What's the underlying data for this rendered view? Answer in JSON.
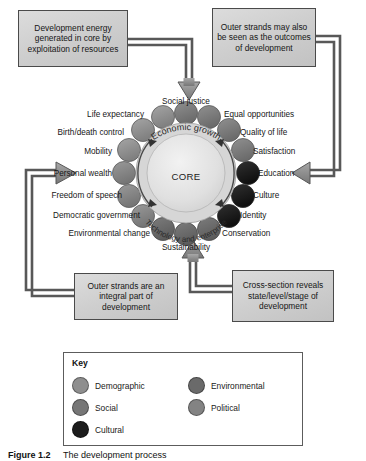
{
  "figure": {
    "caption_label": "Figure 1.2",
    "caption_text": "The development process"
  },
  "boxes": {
    "development_energy": "Development energy generated in core by exploitation of resources",
    "outer_strands_outcomes": "Outer strands may also be seen as the outcomes of development",
    "outer_strands_integral": "Outer strands are an integral part of development",
    "cross_section": "Cross-section reveals state/level/stage of development"
  },
  "core": {
    "center_label": "CORE",
    "top_arc": "Economic growth",
    "bottom_arc": "Technology and enterprise"
  },
  "ring_labels": [
    {
      "text": "Social justice",
      "category": "social"
    },
    {
      "text": "Equal opportunities",
      "category": "social"
    },
    {
      "text": "Quality of life",
      "category": "social"
    },
    {
      "text": "Satisfaction",
      "category": "social"
    },
    {
      "text": "Education",
      "category": "cultural"
    },
    {
      "text": "Culture",
      "category": "cultural"
    },
    {
      "text": "Identity",
      "category": "cultural"
    },
    {
      "text": "Conservation",
      "category": "environmental"
    },
    {
      "text": "Sustainability",
      "category": "environmental"
    },
    {
      "text": "Environmental change",
      "category": "environmental"
    },
    {
      "text": "Democratic government",
      "category": "political"
    },
    {
      "text": "Freedom of speech",
      "category": "political"
    },
    {
      "text": "Personal wealth",
      "category": "political"
    },
    {
      "text": "Mobility",
      "category": "demographic"
    },
    {
      "text": "Birth/death control",
      "category": "demographic"
    },
    {
      "text": "Life expectancy",
      "category": "demographic"
    }
  ],
  "key": {
    "title": "Key",
    "items": [
      {
        "label": "Demographic",
        "color": "#8e8e8e"
      },
      {
        "label": "Social",
        "color": "#767676"
      },
      {
        "label": "Cultural",
        "color": "#1c1c1c"
      },
      {
        "label": "Environmental",
        "color": "#6a6a6a"
      },
      {
        "label": "Political",
        "color": "#838383"
      }
    ]
  },
  "colors": {
    "box_fill": "#cfcfcf",
    "box_border": "#4a4a4a",
    "arrow_fill": "#8a8a8a",
    "arrow_stroke": "#4f4f4f",
    "core_fill": "#e2e2e2",
    "ring_band": "#d8d8d8"
  }
}
